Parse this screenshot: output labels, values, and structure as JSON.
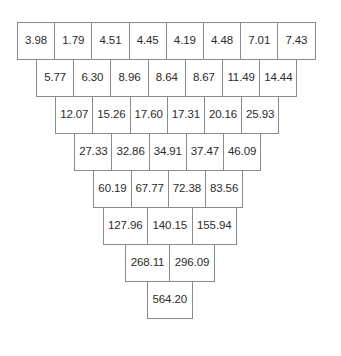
{
  "figure": {
    "type": "summation-pyramid",
    "background_color": "#ffffff",
    "border_color": "#8a8a8a",
    "text_color": "#2b2b2b"
  },
  "chart_data": {
    "type": "table",
    "title": "",
    "xlabel": "",
    "ylabel": "",
    "rows": [
      {
        "index": 0,
        "values": [
          "3.98",
          "1.79",
          "4.51",
          "4.45",
          "4.19",
          "4.48",
          "7.01",
          "7.43"
        ]
      },
      {
        "index": 1,
        "values": [
          "5.77",
          "6.30",
          "8.96",
          "8.64",
          "8.67",
          "11.49",
          "14.44"
        ]
      },
      {
        "index": 2,
        "values": [
          "12.07",
          "15.26",
          "17.60",
          "17.31",
          "20.16",
          "25.93"
        ]
      },
      {
        "index": 3,
        "values": [
          "27.33",
          "32.86",
          "34.91",
          "37.47",
          "46.09"
        ]
      },
      {
        "index": 4,
        "values": [
          "60.19",
          "67.77",
          "72.38",
          "83.56"
        ]
      },
      {
        "index": 5,
        "values": [
          "127.96",
          "140.15",
          "155.94"
        ]
      },
      {
        "index": 6,
        "values": [
          "268.11",
          "296.09"
        ]
      },
      {
        "index": 7,
        "values": [
          "564.20"
        ]
      }
    ]
  }
}
